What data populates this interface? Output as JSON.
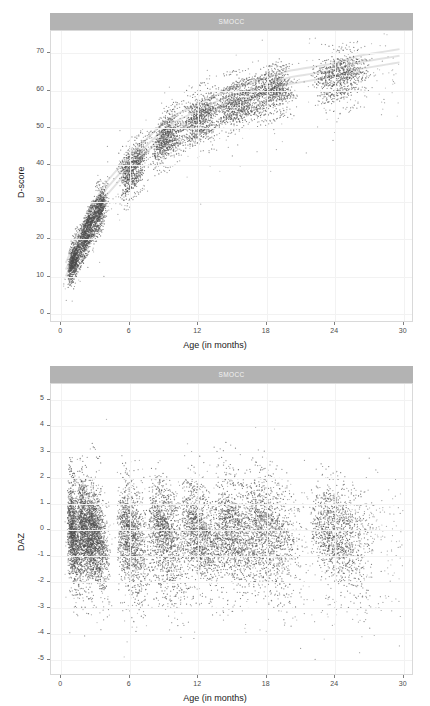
{
  "figure": {
    "background": "#ffffff",
    "strip_fill": "#b3b3b3",
    "strip_text_color": "#f2f2f2",
    "point_color": "#4d4d4d",
    "grid_color": "#f2f2f2",
    "panel_border": "#d9d9d9"
  },
  "panels": [
    {
      "strip_label": "SMOCC",
      "ylabel": "D-score",
      "xlabel": "Age (in months)",
      "yticks": [
        "0",
        "10",
        "20",
        "30",
        "40",
        "50",
        "60",
        "70"
      ],
      "xticks": [
        "0",
        "6",
        "12",
        "18",
        "24",
        "30"
      ]
    },
    {
      "strip_label": "SMOCC",
      "ylabel": "DAZ",
      "xlabel": "Age (in months)",
      "yticks": [
        "-5",
        "-4",
        "-3",
        "-2",
        "-1",
        "0",
        "1",
        "2",
        "3",
        "4",
        "5"
      ],
      "xticks": [
        "0",
        "6",
        "12",
        "18",
        "24",
        "30"
      ]
    }
  ],
  "chart_data": [
    {
      "type": "scatter",
      "title": "SMOCC",
      "xlabel": "Age (in months)",
      "ylabel": "D-score",
      "xlim": [
        -0.9,
        30.9
      ],
      "ylim": [
        -2.5,
        76
      ],
      "xticks": [
        0,
        6,
        12,
        18,
        24,
        30
      ],
      "yticks": [
        0,
        10,
        20,
        30,
        40,
        50,
        60,
        70
      ],
      "grid": true,
      "legend": "none",
      "description": "Individual child D-score measurements against age in months, SMOCC cohort. Longitudinal observations cluster at scheduled visit ages (approx. 1, 2, 3, 6, 9, 12, 15, 18, 24 months) forming dense vertical bands connected by short rising trajectory streaks. The overall growth curve rises steeply from about D-score 5-15 near birth to roughly 60-70 by 24-30 months, flattening with age.",
      "visit_ages": [
        1,
        2,
        3,
        6,
        9,
        12,
        15,
        18,
        24
      ],
      "median_curve": {
        "x": [
          0.5,
          1,
          2,
          3,
          4,
          6,
          8,
          9,
          10,
          12,
          14,
          15,
          16,
          18,
          20,
          22,
          24,
          26,
          28,
          30
        ],
        "y": [
          9,
          13,
          20,
          26,
          31,
          38,
          44,
          47,
          49,
          52,
          55,
          56,
          57,
          59,
          61,
          62,
          63,
          65,
          66,
          67
        ]
      },
      "spread_sd": {
        "x": [
          0.5,
          1,
          3,
          6,
          9,
          12,
          15,
          18,
          24,
          30
        ],
        "y": [
          2.2,
          2.6,
          3.2,
          3.4,
          3.6,
          3.8,
          3.8,
          3.8,
          3.6,
          3.2
        ]
      },
      "n_points_approx": 5000
    },
    {
      "type": "scatter",
      "title": "SMOCC",
      "xlabel": "Age (in months)",
      "ylabel": "DAZ",
      "xlim": [
        -0.9,
        30.9
      ],
      "ylim": [
        -5.6,
        5.6
      ],
      "xticks": [
        0,
        6,
        12,
        18,
        24,
        30
      ],
      "yticks": [
        -5,
        -4,
        -3,
        -2,
        -1,
        0,
        1,
        2,
        3,
        4,
        5
      ],
      "grid": true,
      "legend": "none",
      "description": "D-score age-adjusted Z-scores (DAZ) against age in months, SMOCC cohort. Points centre on 0 with most mass between -2 and +2. Within each scheduled visit wave the points form characteristic downward-sloping fan streaks, starting near +2 at the left edge of each wave and falling toward -3. A scattering of low outliers reaches -4 to -5.",
      "visit_ages": [
        1,
        2,
        3,
        6,
        9,
        12,
        15,
        18,
        24
      ],
      "median_curve": {
        "x": [
          0,
          6,
          12,
          18,
          24,
          30
        ],
        "y": [
          0,
          0,
          0,
          0,
          0,
          0
        ]
      },
      "spread_sd": {
        "x": [
          0,
          6,
          12,
          18,
          24,
          30
        ],
        "y": [
          1.0,
          1.0,
          1.0,
          1.0,
          1.0,
          1.0
        ]
      },
      "n_points_approx": 5000
    }
  ]
}
